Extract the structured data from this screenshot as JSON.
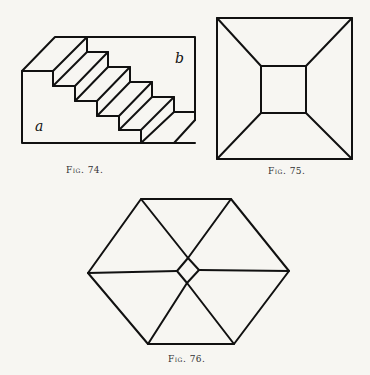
{
  "figures": [
    {
      "id": "fig74",
      "caption": "Fig. 74.",
      "labels": {
        "front_face": "a",
        "back_face": "b"
      },
      "description": "Isometric staircase block with five steps"
    },
    {
      "id": "fig75",
      "caption": "Fig. 75.",
      "description": "Square with inner square connected at corners (truncated pyramid top view)"
    },
    {
      "id": "fig76",
      "caption": "Fig. 76.",
      "description": "Hexagon with three diagonals meeting at a small central diamond"
    }
  ],
  "colors": {
    "ink": "#111111",
    "paper": "#f7f6f2"
  }
}
